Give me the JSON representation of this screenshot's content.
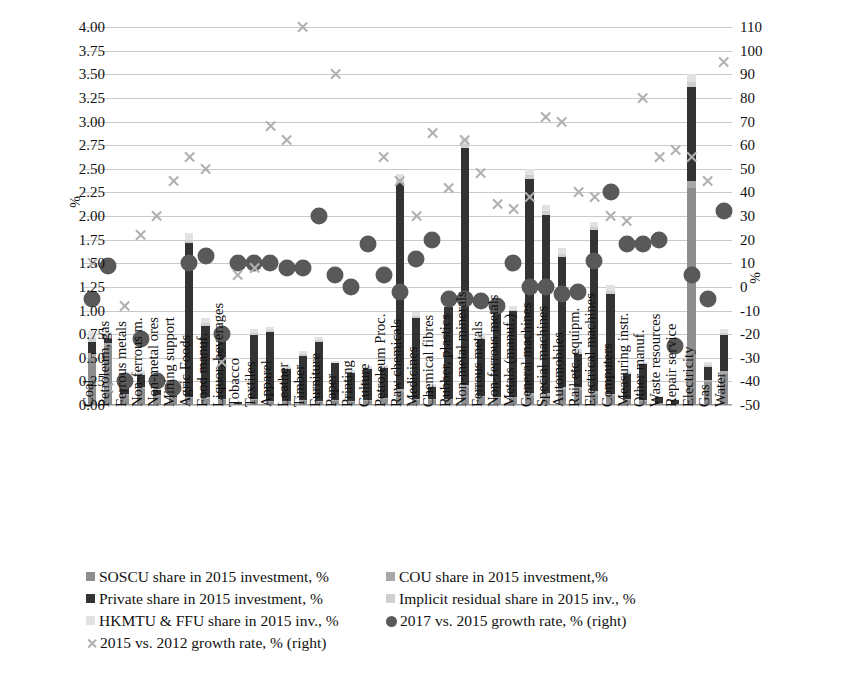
{
  "chart_data": {
    "type": "bar",
    "title": "",
    "xlabel": "",
    "ylabel": "%",
    "ylabel_right": "%",
    "ylim": [
      0,
      4.0
    ],
    "ylim_right": [
      -50,
      110
    ],
    "yticks": [
      "0.00",
      "0.25",
      "0.50",
      "0.75",
      "1.00",
      "1.25",
      "1.50",
      "1.75",
      "2.00",
      "2.25",
      "2.50",
      "2.75",
      "3.00",
      "3.25",
      "3.50",
      "3.75",
      "4.00"
    ],
    "yticks_right": [
      "-50",
      "-40",
      "-30",
      "-20",
      "-10",
      "0",
      "10",
      "20",
      "30",
      "40",
      "50",
      "60",
      "70",
      "80",
      "90",
      "100",
      "110"
    ],
    "grid": true,
    "legend_position": "bottom",
    "categories": [
      "Coal",
      "Petroleum, gas",
      "Ferrous metals",
      "Non-ferrous m.",
      "Non-metal ores",
      "Mining support",
      "Agric Foods",
      "Food manuf.",
      "Liquor, beverages",
      "Tobacco",
      "Textiles",
      "Apparel",
      "Leather",
      "Timber",
      "Furniture",
      "Paper",
      "Printing",
      "Culture",
      "Petroleum Proc.",
      "Raw chemicals",
      "Medicines",
      "Chemical fibres",
      "Rubber, plastics",
      "Non-metal minerals",
      "Ferrous metals",
      "Non-ferrous metals",
      "Metals (manuf.)",
      "General machines",
      "Special machines",
      "Automobiles",
      "Rail etc. equipm.",
      "Electrical machines",
      "Computers",
      "Measuring instr.",
      "Other manuf.",
      "Waste resources",
      "Repair service",
      "Electricity",
      "Gas",
      "Water"
    ],
    "series": [
      {
        "name": "SOSCU share in 2015 investment, %",
        "key": "soscu",
        "color": "#8e8e8e",
        "axis": "left",
        "values": [
          0.5,
          0.62,
          0.1,
          0.17,
          0.1,
          0.08,
          0.07,
          0.06,
          0.05,
          0.01,
          0.05,
          0.03,
          0.03,
          0.04,
          0.03,
          0.04,
          0.03,
          0.04,
          0.06,
          0.14,
          0.05,
          0.05,
          0.05,
          0.18,
          0.08,
          0.07,
          0.07,
          0.1,
          0.1,
          0.16,
          0.16,
          0.12,
          0.1,
          0.05,
          0.04,
          0.02,
          0.01,
          2.3,
          0.24,
          0.33
        ]
      },
      {
        "name": "COU share in 2015 investment,%",
        "key": "cou",
        "color": "#a8a8a8",
        "axis": "left",
        "values": [
          0.05,
          0.04,
          0.02,
          0.02,
          0.01,
          0.01,
          0.02,
          0.02,
          0.01,
          0.0,
          0.01,
          0.01,
          0.01,
          0.01,
          0.01,
          0.01,
          0.01,
          0.01,
          0.01,
          0.03,
          0.01,
          0.01,
          0.01,
          0.03,
          0.02,
          0.02,
          0.02,
          0.03,
          0.03,
          0.03,
          0.03,
          0.03,
          0.02,
          0.01,
          0.01,
          0.0,
          0.0,
          0.07,
          0.03,
          0.03
        ]
      },
      {
        "name": "Private share in 2015 investment, %",
        "key": "private",
        "color": "#333333",
        "axis": "left",
        "values": [
          0.12,
          0.04,
          0.06,
          0.13,
          0.05,
          0.06,
          1.62,
          0.76,
          0.62,
          0.02,
          0.68,
          0.73,
          0.34,
          0.47,
          0.63,
          0.39,
          0.3,
          0.33,
          0.32,
          2.18,
          0.86,
          0.13,
          0.98,
          2.51,
          0.6,
          0.88,
          0.9,
          2.26,
          1.88,
          1.38,
          0.35,
          1.7,
          1.06,
          0.27,
          0.38,
          0.07,
          0.04,
          1.0,
          0.13,
          0.38
        ]
      },
      {
        "name": "Implicit residual share in 2015 inv., %",
        "key": "implicit",
        "color": "#cfcfcf",
        "axis": "left",
        "values": [
          0.04,
          0.03,
          0.02,
          0.02,
          0.01,
          0.01,
          0.04,
          0.03,
          0.02,
          0.0,
          0.02,
          0.02,
          0.01,
          0.02,
          0.02,
          0.01,
          0.01,
          0.01,
          0.01,
          0.04,
          0.02,
          0.01,
          0.02,
          0.04,
          0.02,
          0.02,
          0.02,
          0.04,
          0.04,
          0.03,
          0.02,
          0.03,
          0.03,
          0.01,
          0.01,
          0.0,
          0.0,
          0.05,
          0.02,
          0.02
        ]
      },
      {
        "name": "HKMTU & FFU share in 2015 inv., %",
        "key": "hkmtu",
        "color": "#e2e2e2",
        "axis": "left",
        "values": [
          0.07,
          0.04,
          0.02,
          0.03,
          0.01,
          0.01,
          0.07,
          0.05,
          0.04,
          0.0,
          0.04,
          0.04,
          0.02,
          0.03,
          0.03,
          0.02,
          0.02,
          0.02,
          0.02,
          0.06,
          0.04,
          0.02,
          0.04,
          0.07,
          0.04,
          0.04,
          0.04,
          0.07,
          0.07,
          0.06,
          0.04,
          0.06,
          0.06,
          0.02,
          0.02,
          0.01,
          0.01,
          0.08,
          0.04,
          0.04
        ]
      },
      {
        "name": "2017 vs. 2015 growth rate, % (right)",
        "key": "growth_17_15",
        "color": "#595959",
        "axis": "right",
        "marker": "circle",
        "values": [
          -5,
          9,
          -40,
          -22,
          -40,
          -43,
          10,
          13,
          -20,
          10,
          10,
          10,
          8,
          8,
          30,
          5,
          0,
          18,
          5,
          -2,
          12,
          20,
          -5,
          -5,
          -6,
          -8,
          10,
          0,
          0,
          -3,
          -2,
          11,
          40,
          18,
          18,
          20,
          -25,
          5,
          -5,
          32
        ]
      },
      {
        "name": "2015 vs. 2012 growth rate, % (right)",
        "key": "growth_15_12",
        "color": "#b0b0b0",
        "axis": "right",
        "marker": "x",
        "values": [
          10,
          -43,
          -8,
          22,
          30,
          45,
          55,
          50,
          -32,
          5,
          8,
          68,
          62,
          110,
          null,
          90,
          null,
          null,
          55,
          45,
          30,
          65,
          42,
          62,
          48,
          35,
          33,
          38,
          72,
          70,
          40,
          38,
          30,
          28,
          80,
          55,
          58,
          55,
          45,
          95
        ]
      }
    ]
  },
  "legend": {
    "items": [
      {
        "label": "SOSCU share in 2015 investment, %",
        "marker": "square",
        "color": "#8e8e8e"
      },
      {
        "label": "COU share in 2015 investment,%",
        "marker": "square",
        "color": "#a8a8a8"
      },
      {
        "label": "Private share in 2015 investment, %",
        "marker": "square",
        "color": "#333333"
      },
      {
        "label": "Implicit residual share in 2015 inv., %",
        "marker": "square",
        "color": "#cfcfcf"
      },
      {
        "label": "HKMTU & FFU share in 2015 inv., %",
        "marker": "square",
        "color": "#e2e2e2"
      },
      {
        "label": "2017 vs. 2015 growth rate, % (right)",
        "marker": "circle",
        "color": "#595959"
      },
      {
        "label": "2015 vs. 2012 growth rate, % (right)",
        "marker": "x",
        "color": "#b0b0b0"
      }
    ]
  }
}
